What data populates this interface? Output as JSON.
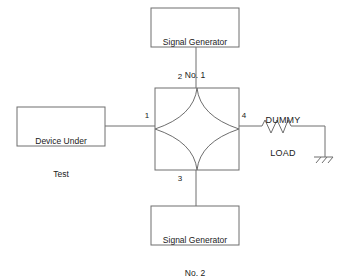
{
  "diagram": {
    "colors": {
      "stroke": "#6e6e6e",
      "text": "#1a1a1a",
      "background": "#ffffff"
    },
    "blocks": {
      "signal_generator_1": {
        "line1": "Signal Generator",
        "line2": "No. 1"
      },
      "signal_generator_2": {
        "line1": "Signal Generator",
        "line2": "No. 2"
      },
      "device_under_test": {
        "line1": "Device Under",
        "line2": "Test"
      },
      "hybrid_coupler": {
        "name": "hybrid-coupler"
      },
      "dummy_load": {
        "line1": "DUMMY",
        "line2": "LOAD"
      },
      "ground": {
        "name": "ground-symbol"
      }
    },
    "ports": {
      "port_1": "1",
      "port_2": "2",
      "port_3": "3",
      "port_4": "4"
    },
    "connections": [
      {
        "from": "device_under_test",
        "to": "port_1"
      },
      {
        "from": "signal_generator_1",
        "to": "port_2"
      },
      {
        "from": "signal_generator_2",
        "to": "port_3"
      },
      {
        "from": "port_4",
        "to": "dummy_load"
      },
      {
        "from": "dummy_load",
        "to": "ground"
      }
    ]
  }
}
